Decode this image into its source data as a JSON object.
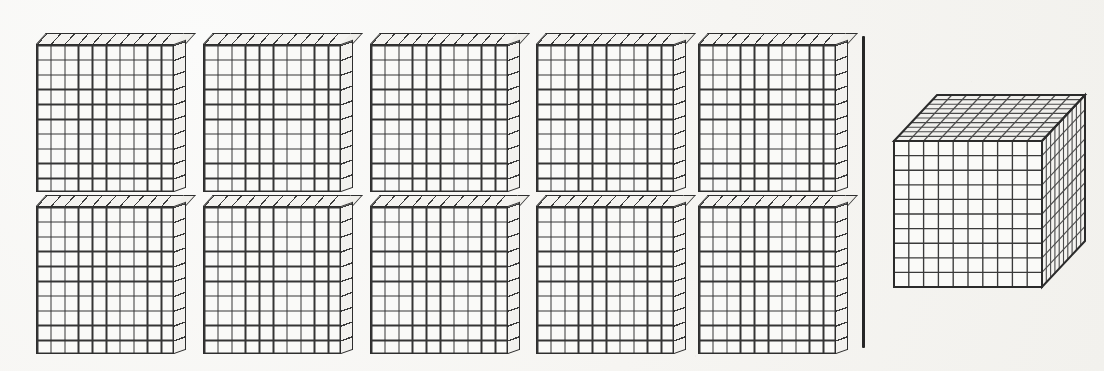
{
  "figure": {
    "type": "math-manipulative-illustration",
    "background_color": "#f7f6f3",
    "line_color": "#2e2e2e",
    "grid_line_color": "#3a3a3a",
    "cell_fill_color": "#fafaf8"
  },
  "left_group": {
    "name": "hundred-flats",
    "count": 10,
    "rows": 2,
    "columns": 5,
    "unit_value": 100,
    "total_value": 1000,
    "flat": {
      "grid_rows": 10,
      "grid_columns": 10,
      "unit_cubes": 100,
      "face_width_px": 138,
      "face_height_px": 148,
      "depth_px": 12
    },
    "items": [
      {
        "index": 1,
        "row": 1,
        "col": 1,
        "x": 36,
        "y": 44
      },
      {
        "index": 2,
        "row": 1,
        "col": 2,
        "x": 203,
        "y": 44
      },
      {
        "index": 3,
        "row": 1,
        "col": 3,
        "x": 370,
        "y": 44
      },
      {
        "index": 4,
        "row": 1,
        "col": 4,
        "x": 536,
        "y": 44
      },
      {
        "index": 5,
        "row": 1,
        "col": 5,
        "x": 698,
        "y": 44
      },
      {
        "index": 6,
        "row": 2,
        "col": 1,
        "x": 36,
        "y": 206
      },
      {
        "index": 7,
        "row": 2,
        "col": 2,
        "x": 203,
        "y": 206
      },
      {
        "index": 8,
        "row": 2,
        "col": 3,
        "x": 370,
        "y": 206
      },
      {
        "index": 9,
        "row": 2,
        "col": 4,
        "x": 536,
        "y": 206
      },
      {
        "index": 10,
        "row": 2,
        "col": 5,
        "x": 698,
        "y": 206
      }
    ]
  },
  "divider": {
    "name": "vertical-separator-line",
    "orientation": "vertical",
    "x": 862,
    "y_top": 36,
    "y_bottom": 348,
    "thickness_px": 2.6,
    "color": "#262626"
  },
  "right_group": {
    "name": "thousand-cube",
    "count": 1,
    "unit_value": 1000,
    "total_value": 1000,
    "cube": {
      "edge_units": 10,
      "grid_rows": 10,
      "grid_columns": 10,
      "grid_layers": 10,
      "unit_cubes": 1000,
      "front_face_x": 894,
      "front_face_y": 141,
      "front_face_width_px": 148,
      "front_face_height_px": 146,
      "depth_offset_x": 43,
      "depth_offset_y": -46,
      "visible_faces": [
        "front",
        "top",
        "right"
      ]
    }
  },
  "equivalence": {
    "left_expression": "10 x 100",
    "right_expression": "1000",
    "relation": "equals"
  }
}
